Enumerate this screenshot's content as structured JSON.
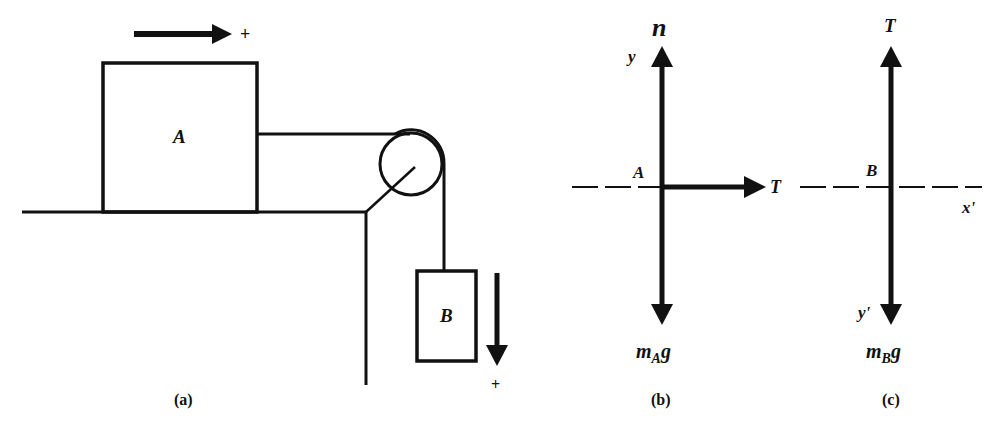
{
  "figure": {
    "panels": [
      {
        "id": "a",
        "caption": "(a)",
        "description": "Block A on horizontal table connected by string over pulley to hanging block B",
        "block_a_label": "A",
        "block_b_label": "B",
        "positive_direction_a": "+",
        "positive_direction_b": "+"
      },
      {
        "id": "b",
        "caption": "(b)",
        "description": "Free-body diagram of block A",
        "origin_label": "A",
        "axis_label": "y",
        "forces": {
          "up": "n",
          "right": "T",
          "down_main": "m",
          "down_sub": "A",
          "down_tail": "g"
        }
      },
      {
        "id": "c",
        "caption": "(c)",
        "description": "Free-body diagram of block B",
        "origin_label": "B",
        "axis_x_label": "x'",
        "axis_y_label": "y'",
        "forces": {
          "up": "T",
          "down_main": "m",
          "down_sub": "B",
          "down_tail": "g"
        }
      }
    ],
    "colors": {
      "ink": "#111111",
      "background": "#ffffff"
    }
  }
}
